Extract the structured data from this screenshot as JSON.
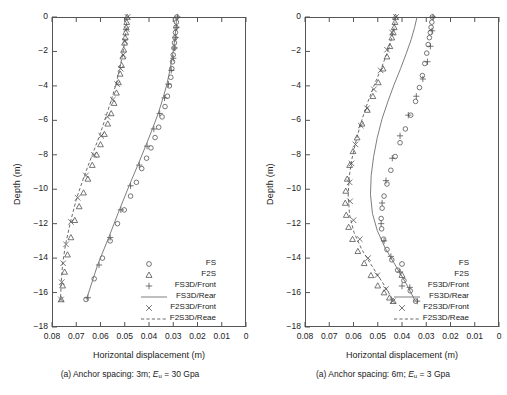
{
  "figure": {
    "axis": {
      "xlabel": "Horizontal displacement (m)",
      "ylabel": "Depth (m)",
      "xticks": [
        "0.08",
        "0.07",
        "0.06",
        "0.05",
        "0.04",
        "0.03",
        "0.02",
        "0.01",
        "0"
      ],
      "yticks": [
        "0",
        "−2",
        "−4",
        "−6",
        "−8",
        "−10",
        "−12",
        "−14",
        "−16",
        "−18"
      ],
      "xlim": [
        0.08,
        0.0
      ],
      "ylim": [
        -18,
        0
      ],
      "x_reversed": true,
      "grid": false
    },
    "legend": {
      "position": "bottom-right-inside",
      "entries": [
        {
          "label": "FS",
          "symbol": "circle"
        },
        {
          "label": "F2S",
          "symbol": "triangle"
        },
        {
          "label": "FS3D/Front",
          "symbol": "plus"
        },
        {
          "label": "FS3D/Rear",
          "symbol": "solid-line"
        },
        {
          "label": "F2S3D/Front",
          "symbol": "cross"
        },
        {
          "label": "F2S3D/Reae",
          "symbol": "dashed-line"
        }
      ]
    },
    "panels": [
      {
        "id": "a-left",
        "caption_prefix": "(a) Anchor spacing: 3m; ",
        "caption_var": "E",
        "caption_sub": "u",
        "caption_suffix": " = 30 Gpa"
      },
      {
        "id": "a-right",
        "caption_prefix": "(a) Anchor spacing: 6m; ",
        "caption_var": "E",
        "caption_sub": "u",
        "caption_suffix": " = 3 Gpa"
      }
    ]
  },
  "chart_data": [
    {
      "type": "scatter",
      "id": "a-left",
      "title": "(a) Anchor spacing: 3m; Eu = 30 Gpa",
      "xlabel": "Horizontal displacement (m)",
      "ylabel": "Depth (m)",
      "xlim": [
        0.08,
        0.0
      ],
      "ylim": [
        -18,
        0
      ],
      "x_reversed": true,
      "grid": false,
      "series": [
        {
          "name": "FS",
          "marker": "circle",
          "x": [
            0.0285,
            0.0287,
            0.0289,
            0.0291,
            0.0293,
            0.0295,
            0.0297,
            0.03,
            0.0303,
            0.0306,
            0.031,
            0.0316,
            0.0324,
            0.0334,
            0.0346,
            0.036,
            0.0375,
            0.0392,
            0.041,
            0.043,
            0.0452,
            0.0476,
            0.0502,
            0.053,
            0.056,
            0.0592,
            0.0626,
            0.066
          ],
          "y": [
            0.0,
            -0.3,
            -0.6,
            -0.9,
            -1.2,
            -1.5,
            -1.8,
            -2.2,
            -2.6,
            -3.0,
            -3.5,
            -4.0,
            -4.6,
            -5.2,
            -5.8,
            -6.4,
            -7.0,
            -7.6,
            -8.2,
            -8.8,
            -9.6,
            -10.4,
            -11.2,
            -12.0,
            -13.0,
            -14.0,
            -15.2,
            -16.4
          ]
        },
        {
          "name": "F2S",
          "marker": "triangle",
          "x": [
            0.049,
            0.0492,
            0.0494,
            0.0496,
            0.0498,
            0.0501,
            0.0504,
            0.0508,
            0.0513,
            0.0519,
            0.0526,
            0.0534,
            0.0544,
            0.0556,
            0.057,
            0.0584,
            0.06,
            0.0616,
            0.0634,
            0.0652,
            0.067,
            0.0688,
            0.0706,
            0.0722,
            0.0736,
            0.0748,
            0.0756,
            0.0762
          ],
          "y": [
            0.0,
            -0.3,
            -0.6,
            -0.9,
            -1.2,
            -1.5,
            -1.9,
            -2.3,
            -2.8,
            -3.3,
            -3.8,
            -4.4,
            -5.0,
            -5.6,
            -6.2,
            -6.8,
            -7.4,
            -8.0,
            -8.6,
            -9.4,
            -10.2,
            -11.0,
            -11.8,
            -12.8,
            -13.8,
            -14.8,
            -15.6,
            -16.4
          ]
        },
        {
          "name": "FS3D/Front",
          "marker": "plus",
          "x": [
            0.0283,
            0.0286,
            0.029,
            0.0294,
            0.03,
            0.0308,
            0.032,
            0.0336,
            0.0356,
            0.038,
            0.0408,
            0.044,
            0.0476,
            0.0516,
            0.056,
            0.0606,
            0.0652
          ],
          "y": [
            0.0,
            -0.6,
            -1.2,
            -1.8,
            -2.4,
            -3.1,
            -3.9,
            -4.7,
            -5.6,
            -6.5,
            -7.5,
            -8.6,
            -9.8,
            -11.2,
            -12.8,
            -14.4,
            -16.3
          ]
        },
        {
          "name": "FS3D/Rear",
          "marker": "solid-line",
          "x": [
            0.0286,
            0.0289,
            0.0293,
            0.0298,
            0.0305,
            0.0314,
            0.0326,
            0.0342,
            0.0362,
            0.0386,
            0.0414,
            0.0446,
            0.0482,
            0.0522,
            0.0566,
            0.0612,
            0.0658
          ],
          "y": [
            0.0,
            -0.6,
            -1.2,
            -1.8,
            -2.4,
            -3.1,
            -3.9,
            -4.7,
            -5.6,
            -6.5,
            -7.5,
            -8.6,
            -9.8,
            -11.2,
            -12.8,
            -14.4,
            -16.4
          ]
        },
        {
          "name": "F2S3D/Front",
          "marker": "cross",
          "x": [
            0.0488,
            0.0492,
            0.0498,
            0.0506,
            0.0517,
            0.0531,
            0.0549,
            0.0571,
            0.0597,
            0.0627,
            0.066,
            0.0694,
            0.0722,
            0.0742,
            0.0754,
            0.076,
            0.0763
          ],
          "y": [
            0.0,
            -0.7,
            -1.4,
            -2.2,
            -3.0,
            -3.9,
            -4.8,
            -5.8,
            -6.9,
            -8.0,
            -9.2,
            -10.5,
            -11.9,
            -13.2,
            -14.3,
            -15.4,
            -16.4
          ]
        },
        {
          "name": "F2S3D/Reae",
          "marker": "dashed-line",
          "x": [
            0.049,
            0.0494,
            0.05,
            0.0509,
            0.0521,
            0.0536,
            0.0555,
            0.0578,
            0.0604,
            0.0634,
            0.0666,
            0.0698,
            0.0724,
            0.0744,
            0.0756,
            0.0762,
            0.0765
          ],
          "y": [
            0.0,
            -0.7,
            -1.4,
            -2.2,
            -3.0,
            -3.9,
            -4.8,
            -5.8,
            -6.9,
            -8.0,
            -9.2,
            -10.5,
            -11.9,
            -13.2,
            -14.3,
            -15.4,
            -16.4
          ]
        }
      ]
    },
    {
      "type": "scatter",
      "id": "a-right",
      "title": "(a) Anchor spacing: 6m; Eu = 3 Gpa",
      "xlabel": "Horizontal displacement (m)",
      "ylabel": "Depth (m)",
      "xlim": [
        0.08,
        0.0
      ],
      "ylim": [
        -18,
        0
      ],
      "x_reversed": true,
      "grid": false,
      "series": [
        {
          "name": "FS",
          "marker": "circle",
          "x": [
            0.0275,
            0.0277,
            0.028,
            0.0283,
            0.0287,
            0.0292,
            0.0298,
            0.0306,
            0.0316,
            0.0328,
            0.0344,
            0.0364,
            0.0386,
            0.0408,
            0.0428,
            0.0446,
            0.0462,
            0.0474,
            0.0482,
            0.0486,
            0.0484,
            0.0476,
            0.0462,
            0.0442,
            0.0418,
            0.0392,
            0.0366,
            0.0344
          ],
          "y": [
            0.0,
            -0.3,
            -0.6,
            -0.9,
            -1.2,
            -1.6,
            -2.1,
            -2.7,
            -3.4,
            -4.1,
            -4.9,
            -5.7,
            -6.5,
            -7.3,
            -8.1,
            -8.9,
            -9.7,
            -10.4,
            -11.1,
            -11.7,
            -12.3,
            -12.9,
            -13.5,
            -14.1,
            -14.7,
            -15.3,
            -15.9,
            -16.5
          ]
        },
        {
          "name": "F2S",
          "marker": "triangle",
          "x": [
            0.0427,
            0.0429,
            0.0432,
            0.0436,
            0.0442,
            0.045,
            0.0462,
            0.0478,
            0.0498,
            0.052,
            0.0543,
            0.0565,
            0.0585,
            0.0602,
            0.0616,
            0.0626,
            0.0632,
            0.0634,
            0.063,
            0.062,
            0.0604,
            0.0582,
            0.0556,
            0.0528,
            0.05,
            0.0474,
            0.0452,
            0.0436
          ],
          "y": [
            0.0,
            -0.3,
            -0.6,
            -0.9,
            -1.2,
            -1.7,
            -2.3,
            -3.0,
            -3.8,
            -4.6,
            -5.4,
            -6.2,
            -7.0,
            -7.8,
            -8.6,
            -9.4,
            -10.1,
            -10.8,
            -11.5,
            -12.2,
            -12.9,
            -13.6,
            -14.3,
            -15.0,
            -15.6,
            -16.0,
            -16.3,
            -16.5
          ]
        },
        {
          "name": "FS3D/Front",
          "marker": "plus",
          "x": [
            0.0272,
            0.0276,
            0.0283,
            0.0295,
            0.0314,
            0.0341,
            0.0374,
            0.0408,
            0.044,
            0.0466,
            0.0482,
            0.0486,
            0.0474,
            0.0446,
            0.0408,
            0.0368,
            0.0337
          ],
          "y": [
            0.0,
            -0.8,
            -1.7,
            -2.6,
            -3.6,
            -4.6,
            -5.7,
            -6.9,
            -8.2,
            -9.5,
            -10.8,
            -12.0,
            -13.0,
            -13.9,
            -14.8,
            -15.7,
            -16.5
          ]
        },
        {
          "name": "FS3D/Rear",
          "marker": "solid-line",
          "x": [
            0.0338,
            0.0348,
            0.0362,
            0.0382,
            0.0406,
            0.0432,
            0.0458,
            0.0482,
            0.0502,
            0.0517,
            0.0527,
            0.053,
            0.0522,
            0.0502,
            0.047,
            0.0428,
            0.0382,
            0.0345
          ],
          "y": [
            0.0,
            -0.6,
            -1.3,
            -2.1,
            -3.0,
            -3.9,
            -4.9,
            -5.9,
            -7.0,
            -8.1,
            -9.2,
            -10.3,
            -11.4,
            -12.4,
            -13.4,
            -14.4,
            -15.5,
            -16.5
          ]
        },
        {
          "name": "F2S3D/Front",
          "marker": "cross",
          "x": [
            0.0425,
            0.0441,
            0.0462,
            0.0488,
            0.0516,
            0.0544,
            0.057,
            0.0592,
            0.0608,
            0.0616,
            0.0614,
            0.06,
            0.0574,
            0.054,
            0.0502,
            0.0466,
            0.0438
          ],
          "y": [
            0.0,
            -0.9,
            -1.9,
            -3.1,
            -4.2,
            -5.3,
            -6.3,
            -7.4,
            -8.5,
            -9.6,
            -10.7,
            -11.8,
            -12.9,
            -14.0,
            -15.0,
            -15.8,
            -16.5
          ]
        },
        {
          "name": "F2S3D/Reae",
          "marker": "dashed-line",
          "x": [
            0.0426,
            0.0432,
            0.0444,
            0.0462,
            0.0486,
            0.0513,
            0.054,
            0.0566,
            0.0588,
            0.0606,
            0.0618,
            0.0622,
            0.0616,
            0.0598,
            0.0566,
            0.0522,
            0.0472,
            0.0434
          ],
          "y": [
            0.0,
            -0.6,
            -1.3,
            -2.1,
            -3.0,
            -3.9,
            -4.9,
            -6.0,
            -7.1,
            -8.2,
            -9.3,
            -10.4,
            -11.5,
            -12.5,
            -13.5,
            -14.5,
            -15.6,
            -16.5
          ]
        }
      ]
    }
  ]
}
